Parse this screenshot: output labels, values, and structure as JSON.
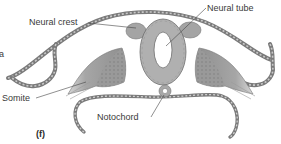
{
  "figure": {
    "panel_label": "(f)",
    "cropped_left_text": "a",
    "labels": {
      "neural_crest": "Neural crest",
      "neural_tube": "Neural tube",
      "somite": "Somite",
      "notochord": "Notochord"
    },
    "colors": {
      "background": "#ffffff",
      "tissue_dark": "#8c8c8c",
      "tissue_mid": "#a8a8a8",
      "tissue_light": "#c8c8c8",
      "outline": "#555555",
      "label_text": "#3a3a3a"
    }
  }
}
